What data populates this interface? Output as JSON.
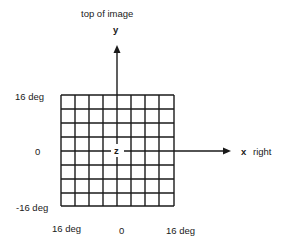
{
  "diagram": {
    "top_label": "top of image",
    "y_axis_label": "y",
    "x_axis_label": "x",
    "x_direction_label": "right",
    "center_label": "z",
    "left_ticks": [
      "16 deg",
      "0",
      "-16 deg"
    ],
    "bottom_ticks": [
      "16 deg",
      "0",
      "16 deg"
    ],
    "grid": {
      "rows": 8,
      "cols": 8
    },
    "colors": {
      "line": "#1a1a1a",
      "background": "#ffffff"
    }
  }
}
